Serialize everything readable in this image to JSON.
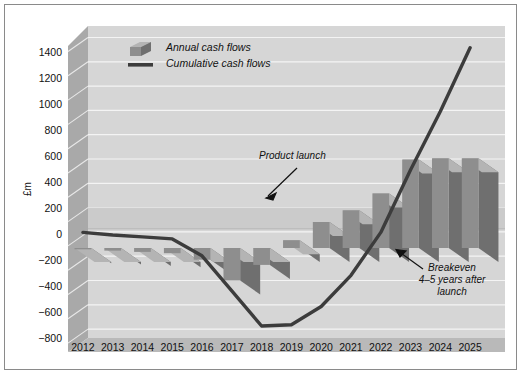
{
  "chart_data": {
    "type": "bar",
    "title": "",
    "subtitle": "",
    "xlabel": "",
    "ylabel": "£m",
    "ylim": [
      -800,
      1600
    ],
    "yticks": [
      1400,
      1200,
      1000,
      800,
      600,
      400,
      200,
      0,
      -200,
      -400,
      -600,
      -800
    ],
    "ytick_labels": [
      "1400",
      "1200",
      "1000",
      "800",
      "600",
      "400",
      "200",
      "0",
      "−200",
      "−400",
      "−600",
      "−800"
    ],
    "grid": true,
    "legend_position": "top-left",
    "categories": [
      "2012",
      "2013",
      "2014",
      "2015",
      "2016",
      "2017",
      "2018",
      "2019",
      "2020",
      "2021",
      "2022",
      "2023",
      "2024",
      "2025"
    ],
    "series": [
      {
        "name": "Annual cash flows",
        "type": "bar",
        "color": "#8e8e8e",
        "values": [
          -10,
          -20,
          -30,
          -40,
          -90,
          -250,
          -130,
          60,
          200,
          290,
          420,
          680,
          690,
          690
        ]
      },
      {
        "name": "Cumulative cash flows",
        "type": "line",
        "color": "#3c3c3c",
        "values": [
          120,
          100,
          85,
          70,
          -60,
          -330,
          -600,
          -590,
          -450,
          -210,
          120,
          600,
          1050,
          1540
        ]
      }
    ],
    "annotations": [
      {
        "id": "product-launch",
        "text": "Product launch",
        "lines": [
          "Product launch"
        ],
        "points_to_category": "2019"
      },
      {
        "id": "breakeven",
        "text": "Breakeven 4–5 years after launch",
        "lines": [
          "Breakeven",
          "4–5 years after",
          "launch"
        ],
        "points_to_category": "2022"
      }
    ]
  },
  "legend": {
    "items": [
      {
        "label": "Annual cash flows",
        "swatch": "bar-swatch"
      },
      {
        "label": "Cumulative cash flows",
        "swatch": "line-swatch"
      }
    ]
  },
  "colors": {
    "bar_front": "#8e8e8e",
    "bar_top": "#b4b4b4",
    "bar_side": "#6f6f6f",
    "line": "#3c3c3c",
    "plot_background": "#d6d6d6",
    "wall_side": "#a9a9a9",
    "floor": "#b9b9b9",
    "gridline": "#f2f2f2",
    "frame_border": "#8a8a8a"
  }
}
